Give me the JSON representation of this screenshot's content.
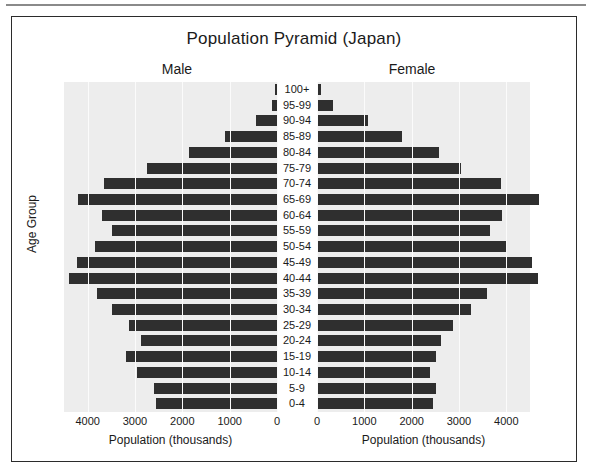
{
  "chart_data": {
    "type": "bar",
    "title": "Population Pyramid (Japan)",
    "subtype": "population-pyramid",
    "xlabel": "Population (thousands)",
    "ylabel": "Age Group",
    "grid": true,
    "legend": "none",
    "panels": [
      {
        "name": "Male",
        "xlim": [
          0,
          4500
        ],
        "direction": "left",
        "ticks": [
          4000,
          3000,
          2000,
          1000,
          0
        ]
      },
      {
        "name": "Female",
        "xlim": [
          0,
          4500
        ],
        "direction": "right",
        "ticks": [
          0,
          1000,
          2000,
          3000,
          4000
        ]
      }
    ],
    "categories": [
      "100+",
      "95-99",
      "90-94",
      "85-89",
      "80-84",
      "75-79",
      "70-74",
      "65-69",
      "60-64",
      "55-59",
      "50-54",
      "45-49",
      "40-44",
      "35-39",
      "30-34",
      "25-29",
      "20-24",
      "15-19",
      "10-14",
      "5-9",
      "0-4"
    ],
    "series": [
      {
        "name": "Male",
        "values": [
          20,
          110,
          450,
          1100,
          1850,
          2750,
          3650,
          4200,
          3700,
          3480,
          3850,
          4230,
          4400,
          3800,
          3480,
          3130,
          2870,
          3200,
          2950,
          2600,
          2550
        ]
      },
      {
        "name": "Female",
        "values": [
          80,
          330,
          1080,
          1800,
          2570,
          3050,
          3880,
          4700,
          3900,
          3650,
          4000,
          4550,
          4660,
          3600,
          3250,
          2870,
          2620,
          2510,
          2380,
          2520,
          2460
        ]
      }
    ],
    "bar_color": "#2f2f2f",
    "plot_background": "#ededed"
  }
}
